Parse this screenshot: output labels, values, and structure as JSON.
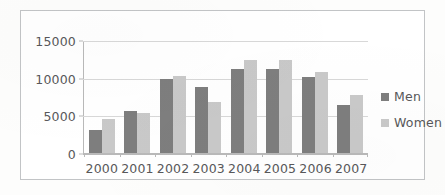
{
  "chart_data": {
    "type": "bar",
    "title": "",
    "xlabel": "",
    "ylabel": "",
    "categories": [
      "2000",
      "2001",
      "2002",
      "2003",
      "2004",
      "2005",
      "2006",
      "2007"
    ],
    "series": [
      {
        "name": "Men",
        "color": "#7e7e7e",
        "values": [
          3000,
          5600,
          9800,
          8750,
          11200,
          11100,
          10050,
          6350
        ]
      },
      {
        "name": "Women",
        "color": "#c9c9c9",
        "values": [
          4500,
          5300,
          10200,
          6750,
          12400,
          12400,
          10750,
          7700
        ]
      }
    ],
    "ylim": [
      0,
      15000
    ],
    "yticks": [
      0,
      5000,
      10000,
      15000
    ],
    "ytick_labels": [
      "0",
      "5000",
      "10000",
      "15000"
    ],
    "grid": true,
    "legend_position": "right"
  },
  "legend": {
    "items": [
      {
        "label": "Men"
      },
      {
        "label": "Women"
      }
    ]
  },
  "colors": {
    "men": "#7e7e7e",
    "women": "#c9c9c9",
    "gridline": "#d8d8d8",
    "axis": "#b9b9b9",
    "text": "#58585a",
    "border": "#c2c4c6",
    "background": "#ffffff"
  }
}
